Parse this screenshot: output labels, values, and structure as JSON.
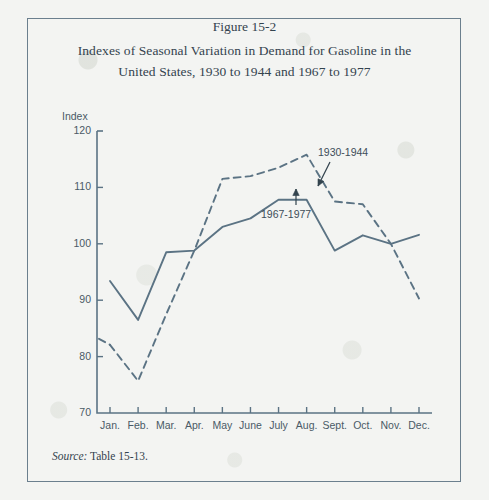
{
  "figure": {
    "number": "Figure 15-2",
    "title_line_1": "Indexes of Seasonal Variation in Demand for Gasoline in the",
    "title_line_2": "United States, 1930 to 1944 and 1967 to 1977",
    "source_prefix": "Source:",
    "source_text": "Table 15-13."
  },
  "colors": {
    "ink": "#33434e",
    "line": "#5b7384",
    "frame": "#6b7f8e",
    "paper": "#f3f4f2",
    "axis_text": "#4a5a66"
  },
  "chart_data": {
    "type": "line",
    "title": "Indexes of Seasonal Variation in Demand for Gasoline in the United States, 1930 to 1944 and 1967 to 1977",
    "xlabel": "",
    "ylabel": "Index",
    "ylim": [
      70,
      120
    ],
    "ytick_values": [
      70,
      80,
      90,
      100,
      110,
      120
    ],
    "ytick_labels": [
      "70",
      "80",
      "90",
      "100",
      "110",
      "120"
    ],
    "grid": false,
    "legend_position": "inline-annotations",
    "categories": [
      "Jan.",
      "Feb.",
      "Mar.",
      "Apr.",
      "May",
      "June",
      "July",
      "Aug.",
      "Sept.",
      "Oct.",
      "Nov.",
      "Dec."
    ],
    "series": [
      {
        "name": "1930-1944",
        "style": "dashed",
        "values": [
          82.1,
          75.7,
          87.5,
          98.8,
          111.5,
          112.0,
          113.5,
          115.8,
          107.5,
          107.0,
          100.0,
          90.3
        ]
      },
      {
        "name": "1967-1977",
        "style": "solid",
        "values": [
          93.4,
          86.5,
          98.5,
          98.8,
          103.0,
          104.5,
          107.8,
          107.8,
          98.8,
          101.5,
          100.0,
          101.6
        ]
      }
    ],
    "annotations": [
      {
        "text": "1930-1944",
        "series": "1930-1944",
        "points_at": "Aug."
      },
      {
        "text": "1967-1977",
        "series": "1967-1977",
        "points_at": "July"
      }
    ]
  }
}
